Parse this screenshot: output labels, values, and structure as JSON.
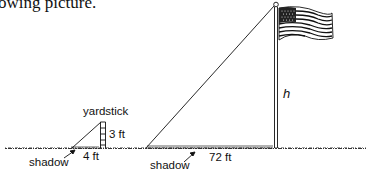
{
  "caption": "owing picture.",
  "labels": {
    "yardstick": "yardstick",
    "yardstick_height": "3 ft",
    "yardstick_shadow_length": "4 ft",
    "shadow_left": "shadow",
    "shadow_right": "shadow",
    "flagpole_shadow_length": "72 ft",
    "flagpole_height": "h"
  },
  "diagram": {
    "objects": [
      "yardstick",
      "flagpole",
      "flag"
    ],
    "yardstick": {
      "height_ft": 3,
      "shadow_ft": 4
    },
    "flagpole": {
      "height": "h",
      "shadow_ft": 72
    }
  },
  "colors": {
    "ink": "#111111",
    "background": "#ffffff"
  }
}
